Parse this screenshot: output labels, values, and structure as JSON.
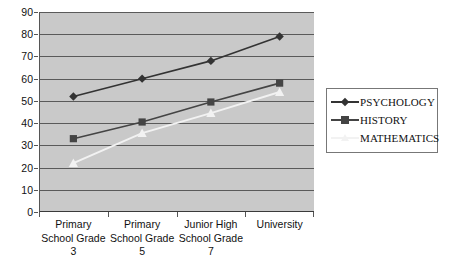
{
  "chart_data": {
    "type": "line",
    "title": "",
    "subtitle": "",
    "xlabel": "",
    "ylabel": "",
    "ylim": [
      0,
      90
    ],
    "ytick_step": 10,
    "yticks": [
      0,
      10,
      20,
      30,
      40,
      50,
      60,
      70,
      80,
      90
    ],
    "grid": true,
    "legend_position": "right",
    "categories": [
      "Primary School Grade 3",
      "Primary School Grade 5",
      "Junior High School Grade 7",
      "University"
    ],
    "category_lines": [
      [
        "Primary",
        "School Grade",
        "3"
      ],
      [
        "Primary",
        "School Grade",
        "5"
      ],
      [
        "Junior High",
        "School Grade",
        "7"
      ],
      [
        "University",
        "",
        ""
      ]
    ],
    "series": [
      {
        "name": "PSYCHOLOGY",
        "marker": "diamond",
        "color": "#333333",
        "values": [
          52,
          60,
          68,
          79
        ]
      },
      {
        "name": "HISTORY",
        "marker": "square",
        "color": "#444444",
        "values": [
          33,
          40.5,
          49.5,
          58
        ]
      },
      {
        "name": "MATHEMATICS",
        "marker": "triangle",
        "color": "#f2f2f2",
        "values": [
          22,
          35.5,
          44.5,
          54
        ]
      }
    ]
  },
  "legend": {
    "items": [
      {
        "label": "PSYCHOLOGY"
      },
      {
        "label": "HISTORY"
      },
      {
        "label": "MATHEMATICS"
      }
    ]
  },
  "colors": {
    "plot_background": "#c9c9c9",
    "gridline": "#5a5a5a",
    "axis": "#555555",
    "text": "#111111",
    "legend_border": "#777777"
  }
}
